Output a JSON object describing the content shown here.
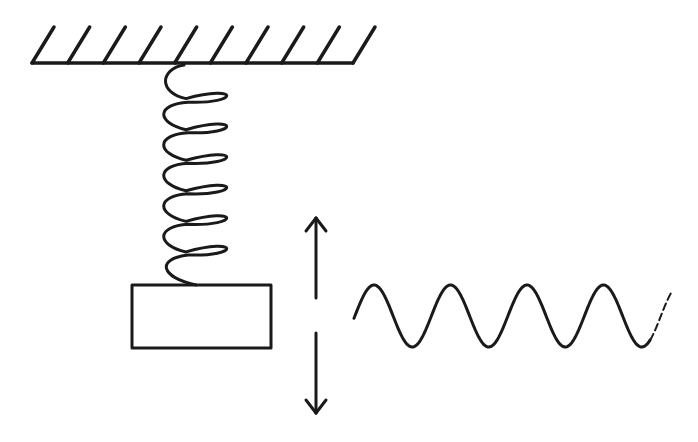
{
  "diagram": {
    "colors": {
      "ink": "#1a1a1a",
      "background": "#ffffff"
    },
    "ceiling": {
      "x1": 32,
      "x2": 353,
      "y": 63,
      "hatch_count": 10,
      "hatch_dx": 22,
      "hatch_dy": 36
    },
    "spring": {
      "top_x": 184,
      "top_y": 65,
      "bottom_y": 285,
      "left_x": 166,
      "right_x": 236,
      "coils": 6
    },
    "mass": {
      "x": 132,
      "y": 285,
      "width": 139,
      "height": 63
    },
    "arrows": {
      "up": {
        "x": 316,
        "y_tip": 218,
        "y_tail": 298
      },
      "down": {
        "x": 316,
        "y_tail": 333,
        "y_tip": 413
      }
    },
    "wave": {
      "x_start": 354,
      "x_solid_end": 650,
      "x_end": 672,
      "center_y": 316,
      "amplitude": 31,
      "period": 76.5,
      "solid_cycles": 4,
      "dashed_tail": true
    }
  }
}
